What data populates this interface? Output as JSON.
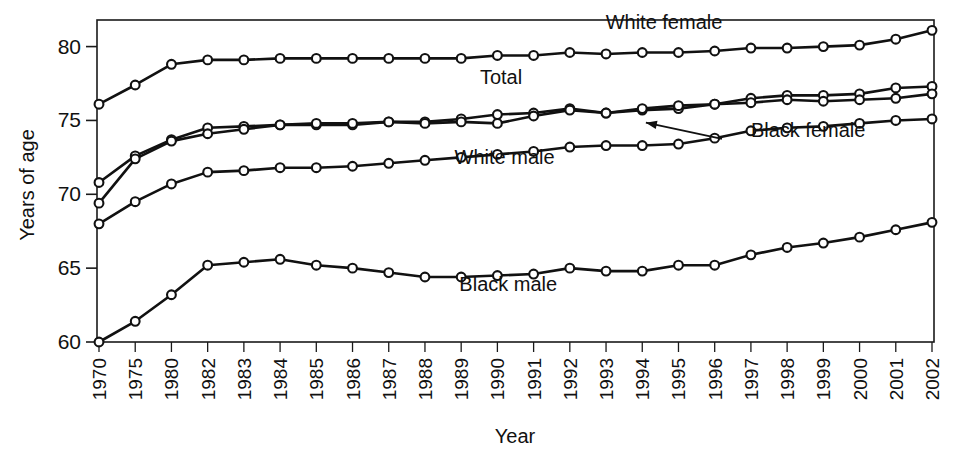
{
  "chart_data": {
    "type": "line",
    "title": "",
    "xlabel": "Year",
    "ylabel": "Years of age",
    "ylim": [
      60,
      81.8
    ],
    "yticks": [
      60,
      65,
      70,
      75,
      80
    ],
    "ytick_labels": [
      "60",
      "65",
      "70",
      "75",
      "80"
    ],
    "grid": false,
    "legend_position": "inline-labels",
    "categories": [
      "1970",
      "1975",
      "1980",
      "1982",
      "1983",
      "1984",
      "1985",
      "1986",
      "1987",
      "1988",
      "1989",
      "1990",
      "1991",
      "1992",
      "1993",
      "1994",
      "1995",
      "1996",
      "1997",
      "1998",
      "1999",
      "2000",
      "2001",
      "2002"
    ],
    "x": [
      1970,
      1975,
      1980,
      1982,
      1983,
      1984,
      1985,
      1986,
      1987,
      1988,
      1989,
      1990,
      1991,
      1992,
      1993,
      1994,
      1995,
      1996,
      1997,
      1998,
      1999,
      2000,
      2001,
      2002
    ],
    "series": [
      {
        "name": "White female",
        "label": "White female",
        "values": [
          76.1,
          77.4,
          78.8,
          79.1,
          79.1,
          79.2,
          79.2,
          79.2,
          79.2,
          79.2,
          79.2,
          79.4,
          79.4,
          79.6,
          79.5,
          79.6,
          79.6,
          79.7,
          79.9,
          79.9,
          80.0,
          80.1,
          80.5,
          81.1
        ],
        "label_x_year": 1994.6,
        "label_y_value": 81.2,
        "label_anchor": "middle"
      },
      {
        "name": "Total",
        "label": "Total",
        "values": [
          70.8,
          72.6,
          73.7,
          74.5,
          74.6,
          74.7,
          74.7,
          74.7,
          74.9,
          74.9,
          75.1,
          75.4,
          75.5,
          75.8,
          75.5,
          75.7,
          75.8,
          76.1,
          76.5,
          76.7,
          76.7,
          76.8,
          77.2,
          77.3
        ],
        "label_x_year": 1990.1,
        "label_y_value": 77.5,
        "label_anchor": "middle"
      },
      {
        "name": "Black female",
        "label": "Black female",
        "values": [
          69.4,
          72.4,
          73.6,
          74.1,
          74.4,
          74.7,
          74.8,
          74.8,
          74.9,
          74.8,
          74.9,
          74.8,
          75.3,
          75.7,
          75.5,
          75.8,
          76.0,
          76.1,
          76.2,
          76.4,
          76.3,
          76.4,
          76.5,
          76.8
        ],
        "label_x_year": 1997.0,
        "label_y_value": 73.9,
        "label_anchor": "start",
        "annotation": {
          "arrow_from_year": 1996.2,
          "arrow_from_value": 73.75,
          "arrow_to_year": 1994.1,
          "arrow_to_value": 74.85
        }
      },
      {
        "name": "White male",
        "label": "White male",
        "values": [
          68.0,
          69.5,
          70.7,
          71.5,
          71.6,
          71.8,
          71.8,
          71.9,
          72.1,
          72.3,
          72.5,
          72.7,
          72.9,
          73.2,
          73.3,
          73.3,
          73.4,
          73.8,
          74.3,
          74.5,
          74.6,
          74.8,
          75.0,
          75.1
        ],
        "label_x_year": 1990.2,
        "label_y_value": 72.05,
        "label_anchor": "middle"
      },
      {
        "name": "Black male",
        "label": "Black male",
        "values": [
          60.0,
          61.4,
          63.2,
          65.2,
          65.4,
          65.6,
          65.2,
          65.0,
          64.7,
          64.4,
          64.4,
          64.5,
          64.6,
          65.0,
          64.8,
          64.8,
          65.2,
          65.2,
          65.9,
          66.4,
          66.7,
          67.1,
          67.6,
          68.1
        ],
        "label_x_year": 1990.3,
        "label_y_value": 63.45,
        "label_anchor": "middle"
      }
    ]
  },
  "axes": {
    "ylabel": "Years of age",
    "xlabel": "Year"
  },
  "colors": {
    "line": "#111111",
    "marker_fill": "#ffffff",
    "frame": "#1a1a1a",
    "background": "#ffffff"
  }
}
